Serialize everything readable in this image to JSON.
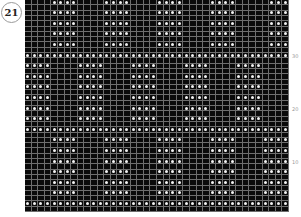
{
  "chart": {
    "number": "21",
    "columns": 40,
    "rows": 40,
    "colors": {
      "background": "#0a0a0a",
      "gridline": "#6e6e6e",
      "dot": "#f2f2f2"
    },
    "row_labels": [
      {
        "label": "30",
        "row": 30
      },
      {
        "label": "20",
        "row": 20
      },
      {
        "label": "10",
        "row": 10
      }
    ],
    "dot_rows": [
      {
        "rows": [
          40,
          38,
          36,
          34,
          32
        ],
        "cols": [
          5,
          6,
          7,
          8,
          13,
          14,
          15,
          16,
          21,
          22,
          23,
          24,
          29,
          30,
          31,
          32,
          38,
          39,
          40
        ]
      },
      {
        "rows": [
          30
        ],
        "cols": "all"
      },
      {
        "rows": [
          28,
          26,
          24,
          22,
          20,
          18
        ],
        "cols": [
          1,
          2,
          3,
          4,
          9,
          10,
          11,
          12,
          17,
          18,
          19,
          20,
          25,
          26,
          27,
          28,
          33,
          34,
          35,
          36
        ]
      },
      {
        "rows": [
          16
        ],
        "cols": "all"
      },
      {
        "rows": [
          14,
          12,
          10,
          8,
          6,
          4
        ],
        "cols": [
          5,
          6,
          7,
          8,
          13,
          14,
          15,
          16,
          21,
          22,
          23,
          24,
          29,
          30,
          31,
          32,
          37,
          38,
          39,
          40
        ]
      },
      {
        "rows": [
          2
        ],
        "cols": "all"
      }
    ]
  }
}
